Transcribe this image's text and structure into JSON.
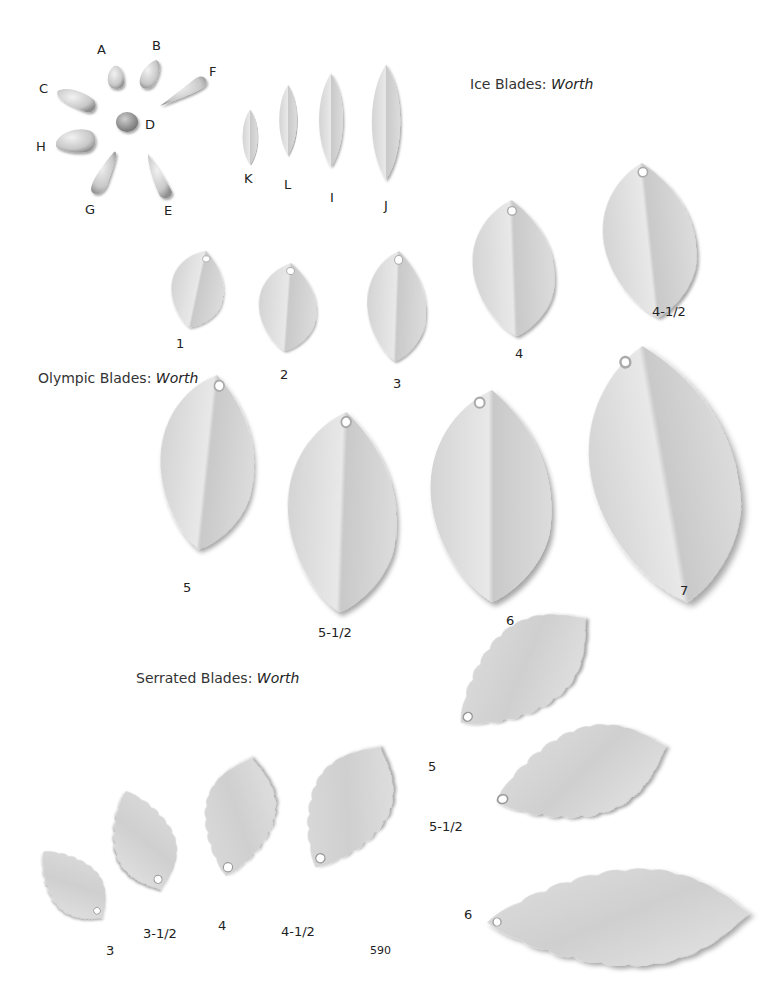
{
  "page_number": "590",
  "sections": {
    "ice": {
      "title": "Ice Blades",
      "separator": ":",
      "brand": "Worth",
      "beads": [
        "A",
        "B",
        "C",
        "D",
        "E",
        "F",
        "G",
        "H"
      ],
      "blades": [
        "K",
        "L",
        "I",
        "J"
      ]
    },
    "olympic": {
      "title": "Olympic Blades",
      "separator": ":",
      "brand": "Worth",
      "sizes": [
        "1",
        "2",
        "3",
        "4",
        "4-1/2",
        "5",
        "5-1/2",
        "6",
        "7"
      ]
    },
    "serrated": {
      "title": "Serrated Blades",
      "separator": ":",
      "brand": "Worth",
      "sizes": [
        "3",
        "3-1/2",
        "4",
        "4-1/2",
        "5",
        "5-1/2",
        "6"
      ]
    }
  },
  "colors": {
    "blade_light": "#e6e6e6",
    "blade_mid": "#cfcfcf",
    "blade_dark": "#9a9a9a",
    "text": "#222222"
  }
}
